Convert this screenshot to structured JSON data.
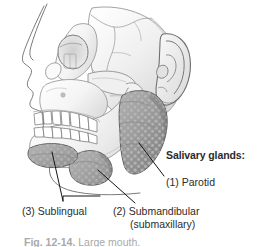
{
  "figure": {
    "heading": "Salivary glands:",
    "labels": [
      {
        "id": "parotid",
        "text": "(1) Parotid",
        "number": "1",
        "name": "Parotid"
      },
      {
        "id": "submandibular",
        "text": "(2) Submandibular",
        "alt_text": "(submaxillary)",
        "number": "2",
        "name": "Submandibular"
      },
      {
        "id": "sublingual",
        "text": "(3) Sublingual",
        "number": "3",
        "name": "Sublingual"
      }
    ],
    "caption": {
      "figure_number": "Fig. 12-14.",
      "text": "Large mouth."
    },
    "colors": {
      "gland_fill": "#9a9a9a",
      "gland_shade": "#7d7d7d",
      "bone_fill": "#f2f2f2",
      "bone_shade": "#d6d6d6",
      "outline": "#5a5a5a",
      "leader_line": "#1a1a1a",
      "text": "#2b2b2b",
      "background": "#ffffff"
    }
  }
}
